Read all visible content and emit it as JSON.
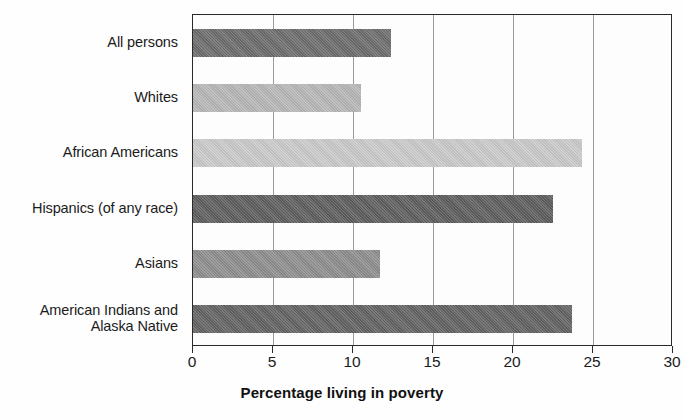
{
  "chart_data": {
    "type": "bar",
    "orientation": "horizontal",
    "title": "",
    "xlabel": "Percentage living in poverty",
    "ylabel": "",
    "categories": [
      "All persons",
      "Whites",
      "African Americans",
      "Hispanics (of any race)",
      "Asians",
      "American Indians and\nAlaska Native"
    ],
    "values": [
      12.4,
      10.5,
      24.3,
      22.5,
      11.7,
      23.7
    ],
    "bar_colors": [
      "#6b6b6b",
      "#b6b6b6",
      "#c9c9c9",
      "#5d5d5d",
      "#8d8d8d",
      "#626262"
    ],
    "xlim": [
      0,
      30
    ],
    "xticks": [
      0,
      5,
      10,
      15,
      20,
      25,
      30
    ],
    "xtick_labels": [
      "0",
      "5",
      "10",
      "15",
      "20",
      "25",
      "30"
    ],
    "grid": "vertical",
    "legend": "none"
  },
  "axis": {
    "x_title": "Percentage living in poverty",
    "frame_color": "#2a2a2a",
    "grid_color": "#9a9a9a"
  }
}
